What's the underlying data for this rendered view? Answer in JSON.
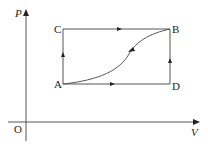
{
  "diagram": {
    "type": "P-V thermodynamic cycle diagram",
    "axes": {
      "y_label": "P",
      "x_label": "V",
      "origin_label": "O"
    },
    "points": [
      {
        "id": "A",
        "label": "A"
      },
      {
        "id": "B",
        "label": "B"
      },
      {
        "id": "C",
        "label": "C"
      },
      {
        "id": "D",
        "label": "D"
      }
    ],
    "paths": [
      {
        "from": "A",
        "to": "C",
        "shape": "vertical line",
        "arrow": "up"
      },
      {
        "from": "C",
        "to": "B",
        "shape": "horizontal line",
        "arrow": "right"
      },
      {
        "from": "A",
        "to": "D",
        "shape": "horizontal line",
        "arrow": "right"
      },
      {
        "from": "D",
        "to": "B",
        "shape": "vertical line",
        "arrow": "up"
      },
      {
        "from": "B",
        "to": "A",
        "shape": "S-shaped curve",
        "arrow": "down-left"
      }
    ],
    "colors": {
      "line": "#555555",
      "text": "#222222",
      "background": "#ffffff"
    }
  }
}
